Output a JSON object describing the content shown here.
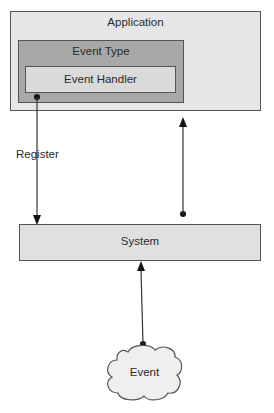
{
  "diagram": {
    "application": {
      "label": "Application",
      "color": "#e6e6e6"
    },
    "event_type": {
      "label": "Event Type",
      "color": "#a8a8a8"
    },
    "event_handler": {
      "label": "Event Handler",
      "color": "#dadada"
    },
    "system": {
      "label": "System",
      "color": "#e0e0e0"
    },
    "event": {
      "label": "Event",
      "color": "#efefef"
    },
    "edges": [
      {
        "from": "event_handler",
        "to": "system",
        "label": "Register"
      },
      {
        "from": "system",
        "to": "application",
        "label": ""
      },
      {
        "from": "event",
        "to": "system",
        "label": ""
      }
    ]
  }
}
